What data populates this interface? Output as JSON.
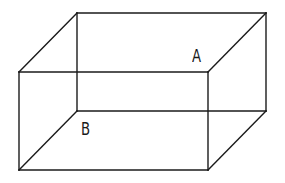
{
  "diagram": {
    "type": "rectangular-cuboid",
    "stroke_color": "#1a1a1a",
    "background_color": "#ffffff",
    "vertices": {
      "front_top_left": [
        19,
        72
      ],
      "front_top_right": [
        208,
        72
      ],
      "front_bottom_left": [
        19,
        170
      ],
      "front_bottom_right": [
        208,
        170
      ],
      "back_top_left": [
        77,
        13
      ],
      "back_top_right": [
        266,
        13
      ],
      "back_bottom_left": [
        77,
        111
      ],
      "back_bottom_right": [
        266,
        111
      ]
    },
    "labels": [
      {
        "id": "A",
        "text": "A",
        "x": 192,
        "y": 48,
        "location": "near front-top-right vertex, on top face side"
      },
      {
        "id": "B",
        "text": "B",
        "x": 81,
        "y": 121,
        "location": "near back-bottom-left vertex, on bottom face"
      }
    ]
  }
}
